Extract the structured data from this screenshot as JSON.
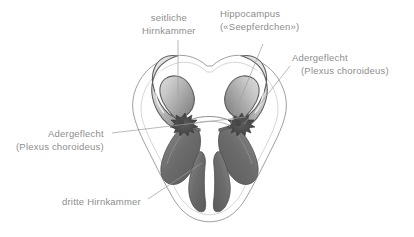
{
  "figure": {
    "title_alt": "Anatomische Zeichnung der Hirnkammern (Ventrikelsystem)",
    "background_color": "#ffffff",
    "ink_color": "#6f6f6f",
    "label_color": "#8d8d8d",
    "fill_dark": "#6e6e6e",
    "fill_mid": "#9a9a9a",
    "fill_light": "#d8d8d8"
  },
  "labels": [
    {
      "id": "seitliche-hirnkammer",
      "line1": "seitliche",
      "line2": "Hirnkammer",
      "leader": "vertical"
    },
    {
      "id": "hippocampus",
      "line1": "Hippocampus",
      "line2": "(«Seepferdchen»)",
      "leader": "diagonal-down-left"
    },
    {
      "id": "adergeflecht-rechts",
      "line1": "Adergeflecht",
      "line2": "(Plexus choroideus)",
      "leader": "diagonal-down-left"
    },
    {
      "id": "adergeflecht-links",
      "line1": "Adergeflecht",
      "line2": "(Plexus choroideus)",
      "leader": "diagonal-right"
    },
    {
      "id": "dritte-hirnkammer",
      "line1": "dritte Hirnkammer",
      "line2": "",
      "leader": "diagonal-up-right"
    }
  ]
}
